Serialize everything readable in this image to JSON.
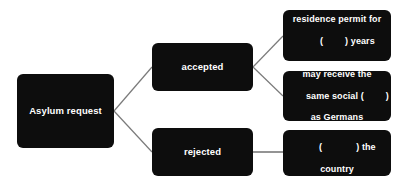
{
  "diagram": {
    "type": "flowchart",
    "background_color": "#ffffff",
    "node_color": "#0d0d0d",
    "node_text_color": "#ffffff",
    "connector_color": "#7a7a7a",
    "nodes": {
      "asylum": {
        "label": "Asylum request",
        "lines": [
          "Asylum request"
        ]
      },
      "accepted": {
        "label": "accepted",
        "lines": [
          "accepted"
        ]
      },
      "rejected": {
        "label": "rejected",
        "lines": [
          "rejected"
        ]
      },
      "permit": {
        "label": "residence permit for (    ) years",
        "lines": [
          "residence permit for",
          "(        ) years"
        ],
        "line1": "residence permit for",
        "line2_before_blank": "(",
        "line2_after_blank": ") years"
      },
      "social": {
        "label": "may receive the same social (    ) as Germans",
        "lines": [
          "may receive the",
          "same social (        )",
          "as Germans"
        ],
        "line1": "may receive the",
        "line2_before_blank": "same social (",
        "line2_after_blank": ")",
        "line3": "as Germans"
      },
      "country": {
        "label": "(          ) the country",
        "lines": [
          "(             ) the",
          "country"
        ],
        "line1_before_blank": "(",
        "line1_after_blank": ") the",
        "line2": "country"
      }
    },
    "edges": [
      {
        "from": "asylum",
        "to": "accepted",
        "style": "diagonal-line"
      },
      {
        "from": "asylum",
        "to": "rejected",
        "style": "diagonal-line"
      },
      {
        "from": "accepted",
        "to": "permit",
        "style": "diagonal-line"
      },
      {
        "from": "accepted",
        "to": "social",
        "style": "diagonal-line"
      },
      {
        "from": "rejected",
        "to": "country",
        "style": "horizontal-line"
      }
    ]
  }
}
